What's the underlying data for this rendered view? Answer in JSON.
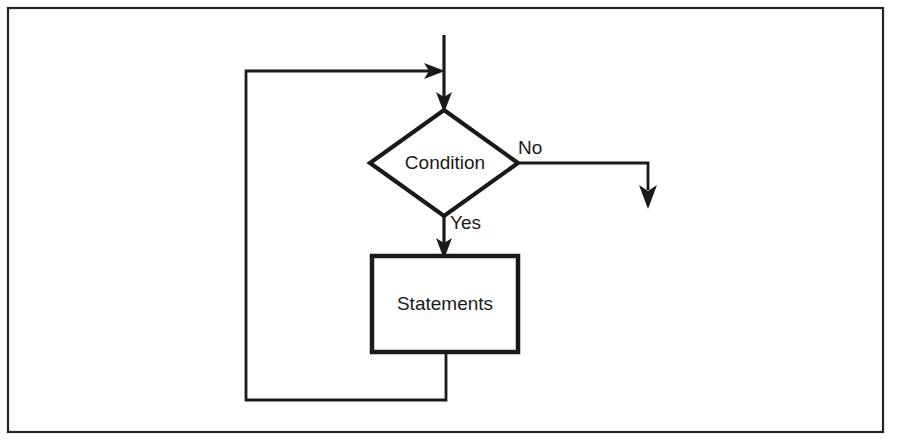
{
  "diagram": {
    "type": "flowchart",
    "background_color": "#ffffff",
    "line_color": "#1a1a1a",
    "frame": {
      "name": "outer-frame",
      "x": 8,
      "y": 8,
      "width": 875,
      "height": 424
    },
    "nodes": [
      {
        "id": "decision",
        "shape": "diamond",
        "label": "Condition",
        "cx": 444,
        "cy": 163,
        "rx": 74,
        "ry": 53
      },
      {
        "id": "process",
        "shape": "rectangle",
        "label": "Statements",
        "x": 372,
        "y": 256,
        "width": 146,
        "height": 96,
        "cx": 445,
        "cy": 304
      }
    ],
    "edges": [
      {
        "id": "entry",
        "label": "",
        "from": "top-entry",
        "to": "decision",
        "points": "444,35 444,110",
        "arrow_at": "444,110",
        "arrow_dir": "down"
      },
      {
        "id": "yes-branch",
        "label": "Yes",
        "label_x": 450,
        "label_y": 224,
        "from": "decision",
        "to": "process",
        "points": "444,216 444,256",
        "arrow_at": "444,256",
        "arrow_dir": "down"
      },
      {
        "id": "no-branch",
        "label": "No",
        "label_x": 518,
        "label_y": 149,
        "from": "decision",
        "to": "exit",
        "points": "518,163 648,163 648,207",
        "arrow_at": "648,207",
        "arrow_dir": "down"
      },
      {
        "id": "loop-back",
        "label": "",
        "from": "process",
        "to": "decision-entry",
        "points": "446,352 446,400 246,400 246,71 444,71",
        "arrow_at": "444,71",
        "arrow_dir": "right"
      }
    ]
  }
}
